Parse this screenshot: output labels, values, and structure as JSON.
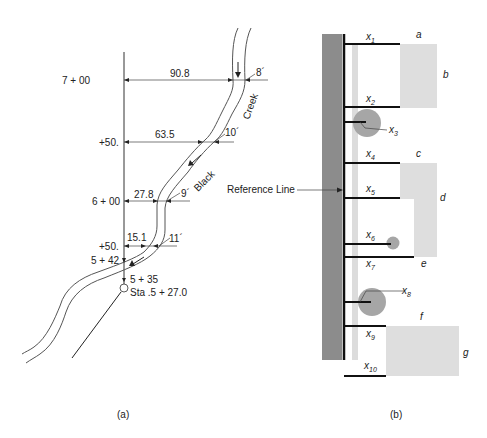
{
  "figure_a": {
    "caption": "(a)",
    "stations": [
      {
        "label": "7 + 00",
        "offset": "90.8",
        "width": "8´"
      },
      {
        "label": "+50.",
        "offset": "63.5",
        "width": "10´"
      },
      {
        "label": "6 + 00",
        "offset": "27.8",
        "width": "9´"
      },
      {
        "label": "+50.",
        "offset": "15.1",
        "width": "11´"
      }
    ],
    "station_542": "5 + 42",
    "station_535": "5 + 35",
    "station_start": "Sta .5 + 27.0",
    "creek_word1": "Creek",
    "creek_word2": "Black"
  },
  "figure_b": {
    "caption": "(b)",
    "reference_label": "Reference Line",
    "offsets": [
      {
        "x": "x",
        "sub": "1"
      },
      {
        "x": "x",
        "sub": "2"
      },
      {
        "x": "x",
        "sub": "3"
      },
      {
        "x": "x",
        "sub": "4"
      },
      {
        "x": "x",
        "sub": "5"
      },
      {
        "x": "x",
        "sub": "6"
      },
      {
        "x": "x",
        "sub": "7"
      },
      {
        "x": "x",
        "sub": "8"
      },
      {
        "x": "x",
        "sub": "9"
      },
      {
        "x": "x",
        "sub": "10"
      }
    ],
    "corners": [
      "a",
      "b",
      "c",
      "d",
      "e",
      "f",
      "g"
    ],
    "colors": {
      "wall": "#8c8c8c",
      "strip": "#dcdcdc",
      "building": "#dedede",
      "tree": "#a6a6a6"
    }
  }
}
